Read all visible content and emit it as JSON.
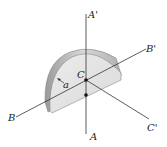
{
  "diagram": {
    "labels": {
      "a_prime": "A'",
      "a": "A",
      "b_prime": "B'",
      "b": "B",
      "c_prime": "C'",
      "c": "C",
      "radius": "a"
    },
    "colors": {
      "disk_face": "#e4e4e4",
      "disk_rim": "#c8c8c8",
      "line": "#333333",
      "point": "#111111"
    }
  }
}
